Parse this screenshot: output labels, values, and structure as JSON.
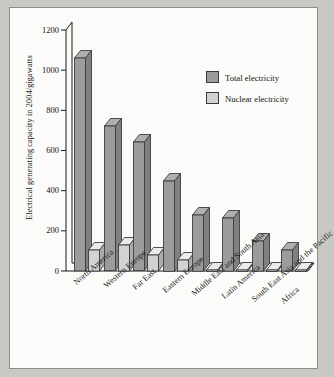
{
  "chart_data": {
    "type": "bar",
    "title": "",
    "xlabel": "",
    "ylabel": "Electrical generating capacity in 2004/gigawatts",
    "ylim": [
      0,
      1200
    ],
    "yticks": [
      0,
      200,
      400,
      600,
      800,
      1000,
      1200
    ],
    "ytick_labels": [
      "0",
      "200",
      "400",
      "600",
      "800",
      "1000",
      "1200"
    ],
    "grid": false,
    "legend_position": "upper-right",
    "categories": [
      "North America",
      "Western Europe",
      "Far East",
      "Eastern Europe",
      "Middle East and South Asia",
      "Latin America",
      "South East Asia and the Pacific",
      "Africa"
    ],
    "series": [
      {
        "name": "Total electricity",
        "color": "#9c9c9c",
        "values": [
          1060,
          720,
          640,
          450,
          280,
          265,
          150,
          105
        ]
      },
      {
        "name": "Nuclear electricity",
        "color": "#d2d2d2",
        "values": [
          105,
          130,
          80,
          55,
          5,
          4,
          2,
          2
        ]
      }
    ]
  },
  "colors": {
    "page_background": "#c9c9c4",
    "plot_background": "#fbfbfa",
    "frame_border": "#8d8d8d",
    "axis": "#1b1b13",
    "total_fill": "#9c9c9c",
    "nuclear_fill": "#d2d2d2",
    "bar_outline": "#3d3d3d",
    "text": "#16160f"
  }
}
